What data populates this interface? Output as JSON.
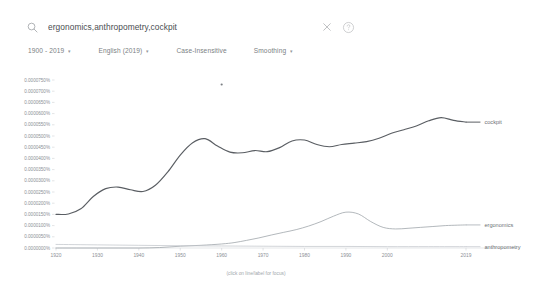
{
  "app": {
    "name": "google-ngram-viewer",
    "background": "#ffffff"
  },
  "search": {
    "value": "ergonomics,anthropometry,cockpit",
    "placeholder": "Search in Google Books",
    "search_icon": "search-icon",
    "clear_icon": "close-icon",
    "help_icon": "help-circle-icon"
  },
  "filters": [
    {
      "label": "1900 - 2019",
      "has_caret": true,
      "name": "year-range-selector"
    },
    {
      "label": "English (2019)",
      "has_caret": true,
      "name": "corpus-selector"
    },
    {
      "label": "Case-Insensitive",
      "has_caret": false,
      "name": "case-insensitive-toggle"
    },
    {
      "label": "Smoothing",
      "has_caret": true,
      "name": "smoothing-selector"
    }
  ],
  "caret_glyph": "▾",
  "chart_data": {
    "type": "line",
    "title": "",
    "xlabel": "(click on line/label for focus)",
    "ylabel": "",
    "grid": false,
    "legend_position": "right-inline",
    "xlim": [
      1920,
      2019
    ],
    "ylim": [
      0.0,
      7.5e-05
    ],
    "x_ticks": [
      "1920",
      "1930",
      "1940",
      "1950",
      "1960",
      "1970",
      "1980",
      "1990",
      "2000",
      "2019"
    ],
    "x_tick_values": [
      1920,
      1930,
      1940,
      1950,
      1960,
      1970,
      1980,
      1990,
      2000,
      2019
    ],
    "y_ticks": [
      "0.0000750%",
      "0.0000700%",
      "0.0000650%",
      "0.0000600%",
      "0.0000550%",
      "0.0000500%",
      "0.0000450%",
      "0.0000400%",
      "0.0000350%",
      "0.0000300%",
      "0.0000250%",
      "0.0000200%",
      "0.0000150%",
      "0.0000100%",
      "0.0000050%",
      "0.0000000%"
    ],
    "y_tick_values": [
      7.5e-05,
      7e-05,
      6.5e-05,
      6e-05,
      5.5e-05,
      5e-05,
      4.5e-05,
      4e-05,
      3.5e-05,
      3e-05,
      2.5e-05,
      2e-05,
      1.5e-05,
      1e-05,
      5e-06,
      0.0
    ],
    "series": [
      {
        "name": "cockpit",
        "color": "#5a5e63",
        "label_x": 2022,
        "x": [
          1920,
          1923,
          1926,
          1929,
          1932,
          1935,
          1938,
          1941,
          1944,
          1947,
          1950,
          1953,
          1956,
          1959,
          1962,
          1965,
          1968,
          1971,
          1974,
          1977,
          1980,
          1983,
          1986,
          1989,
          1992,
          1995,
          1998,
          2001,
          2004,
          2007,
          2010,
          2013,
          2016,
          2019
        ],
        "values": [
          1.5e-05,
          1.52e-05,
          1.75e-05,
          2.3e-05,
          2.65e-05,
          2.72e-05,
          2.6e-05,
          2.52e-05,
          2.8e-05,
          3.4e-05,
          4.15e-05,
          4.7e-05,
          4.88e-05,
          4.55e-05,
          4.28e-05,
          4.25e-05,
          4.35e-05,
          4.3e-05,
          4.48e-05,
          4.78e-05,
          4.82e-05,
          4.62e-05,
          4.52e-05,
          4.62e-05,
          4.68e-05,
          4.75e-05,
          4.9e-05,
          5.12e-05,
          5.28e-05,
          5.45e-05,
          5.68e-05,
          5.82e-05,
          5.7e-05,
          5.62e-05
        ]
      },
      {
        "name": "ergonomics",
        "color": "#9aa0a6",
        "label_x": 2022,
        "x": [
          1920,
          1925,
          1930,
          1935,
          1940,
          1945,
          1950,
          1955,
          1960,
          1963,
          1966,
          1969,
          1972,
          1975,
          1978,
          1981,
          1984,
          1987,
          1990,
          1993,
          1996,
          1999,
          2002,
          2005,
          2008,
          2011,
          2014,
          2017,
          2019
        ],
        "values": [
          0.0,
          0.0,
          0.0,
          0.0,
          0.0,
          2e-07,
          8e-07,
          1.2e-06,
          1.8e-06,
          2.4e-06,
          3.4e-06,
          4.5e-06,
          5.8e-06,
          7e-06,
          8.2e-06,
          9.8e-06,
          1.18e-05,
          1.42e-05,
          1.6e-05,
          1.52e-05,
          1.18e-05,
          9.2e-06,
          8.5e-06,
          8.8e-06,
          9.2e-06,
          9.6e-06,
          1e-05,
          1.02e-05,
          1.03e-05
        ]
      },
      {
        "name": "anthropometry",
        "color": "#c2c6cb",
        "label_x": 2022,
        "x": [
          1920,
          1930,
          1940,
          1950,
          1960,
          1970,
          1980,
          1990,
          2000,
          2010,
          2019
        ],
        "values": [
          1.6e-06,
          1.4e-06,
          1.2e-06,
          1e-06,
          9e-07,
          8e-07,
          7e-07,
          7e-07,
          6e-07,
          6e-07,
          6e-07
        ]
      }
    ],
    "annotations": [
      {
        "type": "point-marker",
        "x": 1960,
        "y": 7.3e-05,
        "name": "chart-point-marker"
      }
    ]
  }
}
